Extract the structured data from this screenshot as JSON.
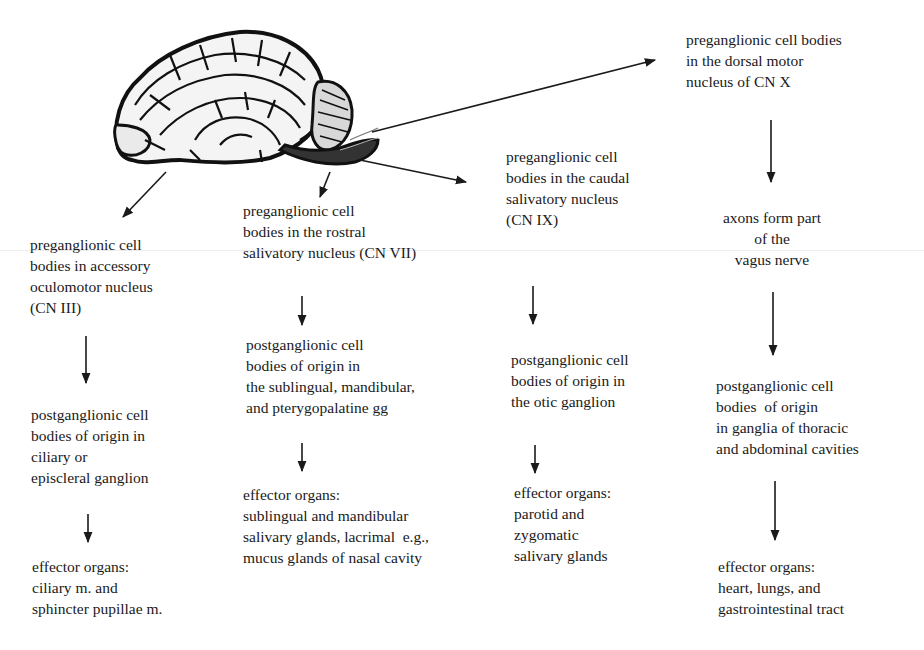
{
  "diagram": {
    "image": {
      "icon": "brain-illustration-icon",
      "description": "lateral view of a brain"
    },
    "columns": [
      {
        "id": "cn-iii",
        "preganglionic": "preganglionic cell\nbodies in accessory\noculomotor nucleus\n(CN III)",
        "postganglionic": "postganglionic cell\nbodies of origin in\nciliary or\nepiscleral ganglion",
        "effector": "effector organs:\nciliary m. and\nsphincter pupillae m."
      },
      {
        "id": "cn-vii",
        "preganglionic": "preganglionic cell\nbodies in the rostral\nsalivatory nucleus (CN VII)",
        "postganglionic": "postganglionic cell\nbodies of origin in\nthe sublingual, mandibular,\nand pterygopalatine gg",
        "effector": "effector organs:\nsublingual and mandibular\nsalivary glands, lacrimal  e.g.,\nmucus glands of nasal cavity"
      },
      {
        "id": "cn-ix",
        "preganglionic": "preganglionic cell\nbodies in the caudal\nsalivatory nucleus\n(CN IX)",
        "postganglionic": "postganglionic cell\nbodies of origin in\nthe otic ganglion",
        "effector": "effector organs:\nparotid and\nzygomatic\nsalivary glands"
      },
      {
        "id": "cn-x",
        "preganglionic": "preganglionic cell bodies\nin the dorsal motor\nnucleus of CN X",
        "intermediate": "axons form part\nof the\nvagus nerve",
        "postganglionic": "postganglionic cell\nbodies  of origin\nin ganglia of thoracic\nand abdominal cavities",
        "effector": "effector organs:\nheart, lungs, and\ngastrointestinal tract"
      }
    ],
    "colors": {
      "ink": "#1a1a1a",
      "background": "#ffffff"
    }
  }
}
